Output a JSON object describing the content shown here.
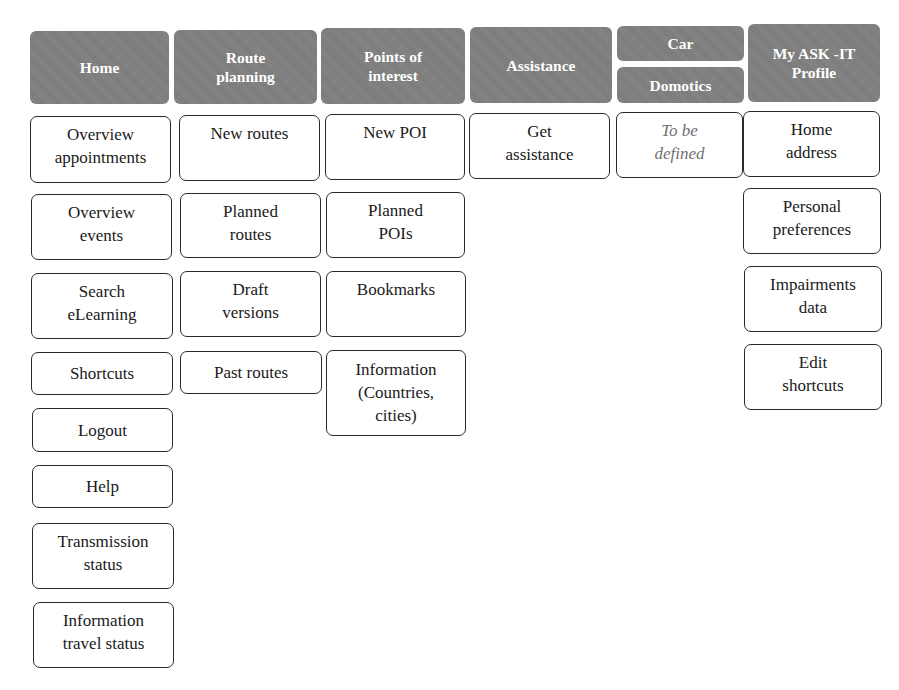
{
  "diagram": {
    "type": "menu-structure",
    "columns": [
      {
        "header": "Home",
        "items": [
          "Overview appointments",
          "Overview events",
          "Search eLearning",
          "Shortcuts",
          "Logout",
          "Help",
          "Transmission status",
          "Information travel status"
        ]
      },
      {
        "header": "Route planning",
        "items": [
          "New routes",
          "Planned routes",
          "Draft versions",
          "Past routes"
        ]
      },
      {
        "header": "Points of interest",
        "items": [
          "New POI",
          "Planned POIs",
          "Bookmarks",
          "Information (Countries, cities)"
        ]
      },
      {
        "header": "Assistance",
        "items": [
          "Get assistance"
        ]
      },
      {
        "header": [
          "Car",
          "Domotics"
        ],
        "items": [
          "To be defined"
        ]
      },
      {
        "header": "My ASK -IT Profile",
        "items": [
          "Home address",
          "Personal preferences",
          "Impairments data",
          "Edit shortcuts"
        ]
      }
    ]
  },
  "headers": {
    "home": [
      "Home"
    ],
    "route": [
      "Route",
      "planning"
    ],
    "poi": [
      "Points of",
      "interest"
    ],
    "assist": [
      "Assistance"
    ],
    "car": [
      "Car"
    ],
    "domotics": [
      "Domotics"
    ],
    "profile": [
      "My ASK -IT",
      "Profile"
    ]
  },
  "home": [
    [
      "Overview",
      "appointments"
    ],
    [
      "Overview",
      "events"
    ],
    [
      "Search",
      "eLearning"
    ],
    [
      "Shortcuts"
    ],
    [
      "Logout"
    ],
    [
      "Help"
    ],
    [
      "Transmission",
      "status"
    ],
    [
      "Information",
      "travel status"
    ]
  ],
  "route": [
    [
      "New routes"
    ],
    [
      "Planned",
      "routes"
    ],
    [
      "Draft",
      "versions"
    ],
    [
      "Past routes"
    ]
  ],
  "poi": [
    [
      "New POI"
    ],
    [
      "Planned",
      "POIs"
    ],
    [
      "Bookmarks"
    ],
    [
      "Information",
      "(Countries,",
      "cities)"
    ]
  ],
  "assist": [
    [
      "Get",
      "assistance"
    ]
  ],
  "car": [
    [
      "To be",
      "defined"
    ]
  ],
  "profile": [
    [
      "Home",
      "address"
    ],
    [
      "Personal",
      "preferences"
    ],
    [
      "Impairments",
      "data"
    ],
    [
      "Edit",
      "shortcuts"
    ]
  ],
  "colors": {
    "header_bg": "#7f7f7f",
    "header_text": "#ffffff",
    "box_border": "#2a2a2a",
    "tbd_text": "#6f6f6f"
  }
}
